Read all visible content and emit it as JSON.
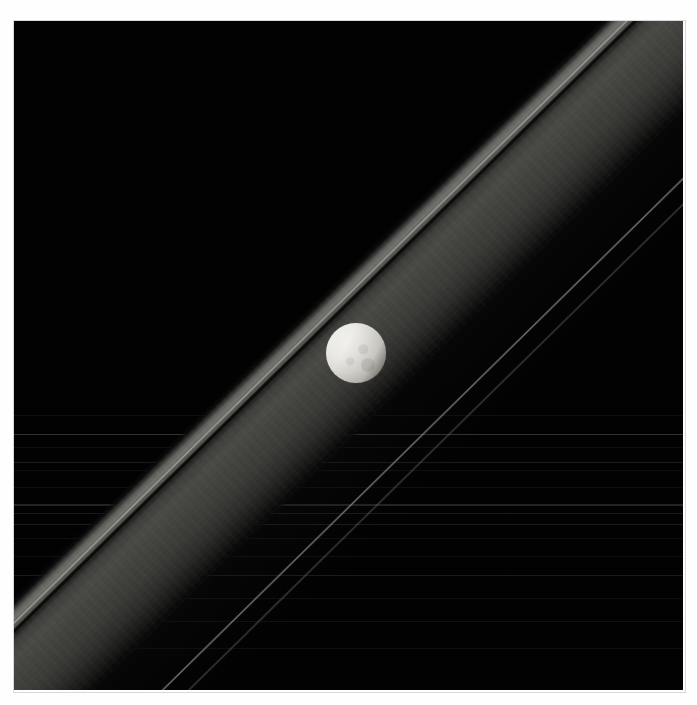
{
  "image": {
    "kind": "astronomical-photograph",
    "subject": "icy moon above planetary ring plane",
    "background_color": "#010101",
    "page_background_color": "#ffffff",
    "plate": {
      "x": 14,
      "y": 21,
      "width": 669,
      "height": 669
    }
  },
  "moon": {
    "label": "moon",
    "center_x": 356,
    "center_y": 353,
    "radius": 30,
    "highlight_color": "#f2f1ee",
    "terminator_color": "#3a3834",
    "illumination_direction": "upper-left"
  },
  "rings": {
    "band_angle_degrees": -44.5,
    "main_band": {
      "label": "main-ring-band",
      "brightest_color": "#767671",
      "body_color": "#4a4a46",
      "width_px": 126
    },
    "gap": {
      "label": "ring-division-gap",
      "color": "#000000"
    },
    "bright_edge": {
      "label": "ring-inner-edge-highlight",
      "color": "#a8a8a2"
    },
    "thin_ringlet": {
      "label": "thin-outer-ringlet",
      "color": "#92928d"
    },
    "thin_ringlet_2": {
      "label": "faint-outer-ringlet",
      "color": "#6e6e6a"
    },
    "halo": {
      "label": "ring-outer-haze",
      "color": "#242422"
    }
  },
  "streaks": {
    "label": "distant-edge-on-ring-lanes",
    "lines": [
      {
        "y": 415,
        "style": "softer"
      },
      {
        "y": 434,
        "style": "normal"
      },
      {
        "y": 447,
        "style": "softer"
      },
      {
        "y": 462,
        "style": "soft"
      },
      {
        "y": 470,
        "style": "softer"
      },
      {
        "y": 487,
        "style": "softer"
      },
      {
        "y": 504,
        "style": "thick"
      },
      {
        "y": 513,
        "style": "soft"
      },
      {
        "y": 524,
        "style": "soft"
      },
      {
        "y": 538,
        "style": "softer"
      },
      {
        "y": 556,
        "style": "softer"
      },
      {
        "y": 575,
        "style": "soft"
      },
      {
        "y": 598,
        "style": "softer"
      },
      {
        "y": 621,
        "style": "softer"
      },
      {
        "y": 648,
        "style": "softer"
      }
    ]
  }
}
